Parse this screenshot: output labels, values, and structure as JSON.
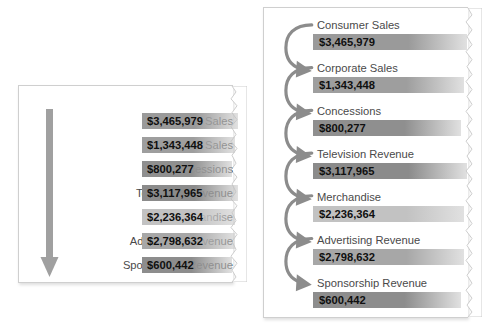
{
  "figure": {
    "background": "#ffffff",
    "panel_background": "#ffffff",
    "panel_border_color": "#cfcfcf",
    "label_color": "#4a4a4a",
    "value_color": "#101010",
    "arrow_color": "#8c8c8c"
  },
  "items": [
    {
      "label": "Consumer Sales",
      "value": "$3,465,979",
      "amount": 3465979,
      "bar_color": "#9a9a9a",
      "bar_width": 96
    },
    {
      "label": "Corporate Sales",
      "value": "$1,343,448",
      "amount": 1343448,
      "bar_color": "#9e9e9e",
      "bar_width": 93
    },
    {
      "label": "Concessions",
      "value": "$800,277",
      "amount": 800277,
      "bar_color": "#8f8f8f",
      "bar_width": 90
    },
    {
      "label": "Television Revenue",
      "value": "$3,117,965",
      "amount": 3117965,
      "bar_color": "#8b8b8b",
      "bar_width": 96
    },
    {
      "label": "Merchandise",
      "value": "$2,236,364",
      "amount": 2236364,
      "bar_color": "#c2c2c2",
      "bar_width": 93
    },
    {
      "label": "Advertising Revenue",
      "value": "$2,798,632",
      "amount": 2798632,
      "bar_color": "#a7a7a7",
      "bar_width": 93
    },
    {
      "label": "Sponsorship Revenue",
      "value": "$600,442",
      "amount": 600442,
      "bar_color": "#8d8d8d",
      "bar_width": 90
    }
  ],
  "left_panel": {
    "name": "compact-inline-layout",
    "flow_indicator": "down-arrow"
  },
  "right_panel": {
    "name": "stacked-flow-layout",
    "flow_indicator": "curved-arrows"
  },
  "chart_data": {
    "type": "bar",
    "title": "",
    "xlabel": "",
    "ylabel": "",
    "categories": [
      "Consumer Sales",
      "Corporate Sales",
      "Concessions",
      "Television Revenue",
      "Merchandise",
      "Advertising Revenue",
      "Sponsorship Revenue"
    ],
    "values": [
      3465979,
      1343448,
      800277,
      3117965,
      2236364,
      2798632,
      600442
    ],
    "value_labels": [
      "$3,465,979",
      "$1,343,448",
      "$800,277",
      "$3,117,965",
      "$2,236,364",
      "$2,798,632",
      "$600,442"
    ],
    "grid": false,
    "legend": "none"
  }
}
